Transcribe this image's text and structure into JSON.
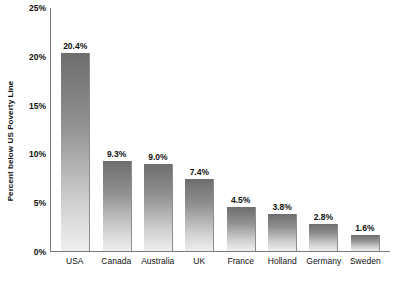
{
  "chart_data": {
    "type": "bar",
    "title": "",
    "xlabel": "",
    "ylabel": "Percent below US Poverty Line",
    "categories": [
      "USA",
      "Canada",
      "Australia",
      "UK",
      "France",
      "Holland",
      "Germany",
      "Sweden"
    ],
    "values": [
      20.4,
      9.3,
      9.0,
      7.4,
      4.5,
      3.8,
      2.8,
      1.6
    ],
    "value_labels": [
      "20.4%",
      "9.3%",
      "9.0%",
      "7.4%",
      "4.5%",
      "3.8%",
      "2.8%",
      "1.6%"
    ],
    "ylim": [
      0,
      25
    ],
    "y_ticks": [
      0,
      5,
      10,
      15,
      20,
      25
    ],
    "y_tick_labels": [
      "0%",
      "5%",
      "10%",
      "15%",
      "20%",
      "25%"
    ],
    "grid": false,
    "legend": null,
    "bar_color_top": "#6e6e6e",
    "bar_color_bottom": "#efefef",
    "axis_color": "#7b7b7b",
    "text_color": "#111111"
  }
}
